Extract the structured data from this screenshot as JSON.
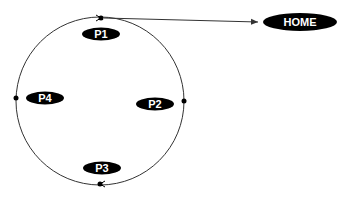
{
  "diagram": {
    "colors": {
      "line": "#333333",
      "node_fill": "#000000",
      "node_text": "#ffffff",
      "background": "#ffffff"
    },
    "circle": {
      "cx": 100,
      "cy": 101,
      "r": 84
    },
    "nodes": [
      {
        "id": "p1",
        "label": "P1",
        "cx": 101,
        "cy": 34,
        "rx": 19,
        "ry": 6.5
      },
      {
        "id": "p2",
        "label": "P2",
        "cx": 155,
        "cy": 104,
        "rx": 19,
        "ry": 6.5
      },
      {
        "id": "p3",
        "label": "P3",
        "cx": 102,
        "cy": 168,
        "rx": 19,
        "ry": 6.5
      },
      {
        "id": "p4",
        "label": "P4",
        "cx": 45,
        "cy": 98,
        "rx": 19,
        "ry": 6.5
      },
      {
        "id": "home",
        "label": "HOME",
        "cx": 300,
        "cy": 22,
        "rx": 37,
        "ry": 9
      }
    ],
    "edges": [
      {
        "from": "top-point",
        "to": "home",
        "directed": true
      }
    ]
  }
}
